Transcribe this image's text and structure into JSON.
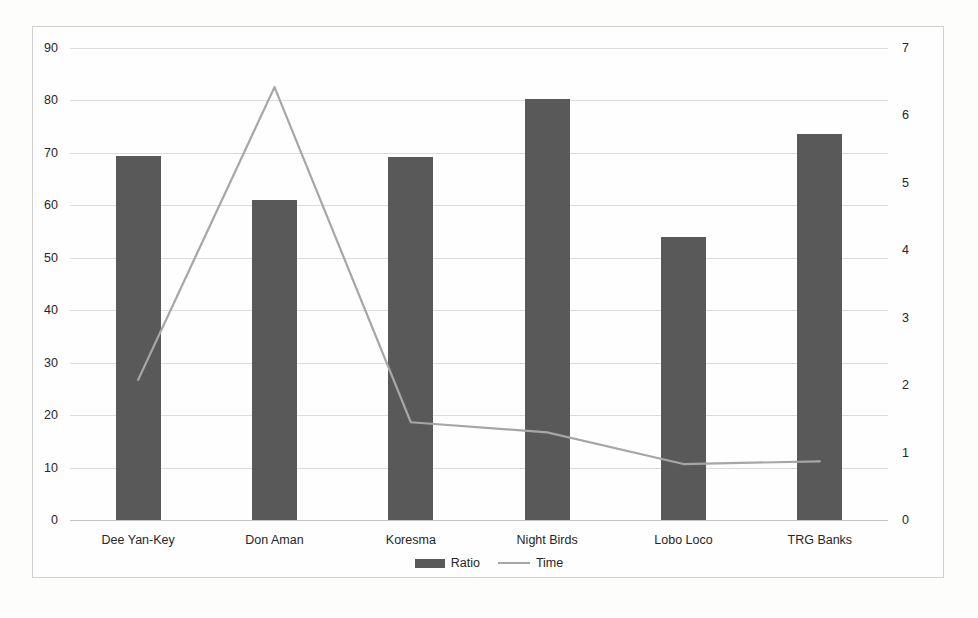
{
  "chart_data": {
    "type": "bar",
    "title": "",
    "xlabel": "",
    "ylabel": "",
    "grid": true,
    "legend_position": "bottom",
    "categories": [
      "Dee Yan-Key",
      "Don Aman",
      "Koresma",
      "Night Birds",
      "Lobo Loco",
      "TRG Banks"
    ],
    "series": [
      {
        "name": "Ratio",
        "type": "bar",
        "axis": "left",
        "color": "#595959",
        "values": [
          69.5,
          61,
          69.3,
          80.3,
          54,
          73.6
        ]
      },
      {
        "name": "Time",
        "type": "line",
        "axis": "right",
        "color": "#a6a6a6",
        "values": [
          2.08,
          6.42,
          1.45,
          1.3,
          0.83,
          0.87
        ]
      }
    ],
    "axes": {
      "left": {
        "min": 0,
        "max": 90,
        "step": 10,
        "ticks": [
          "0",
          "10",
          "20",
          "30",
          "40",
          "50",
          "60",
          "70",
          "80",
          "90"
        ]
      },
      "right": {
        "min": 0,
        "max": 7,
        "step": 1,
        "ticks": [
          "0",
          "1",
          "2",
          "3",
          "4",
          "5",
          "6",
          "7"
        ]
      }
    }
  },
  "legend": {
    "items": [
      {
        "label": "Ratio",
        "marker": "bar-swatch"
      },
      {
        "label": "Time",
        "marker": "line-swatch"
      }
    ]
  },
  "colors": {
    "bar": "#595959",
    "line": "#a6a6a6",
    "grid": "#dcdcdc",
    "frame": "#cfcfcf",
    "text": "#262626",
    "background": "#fdfdfc"
  }
}
